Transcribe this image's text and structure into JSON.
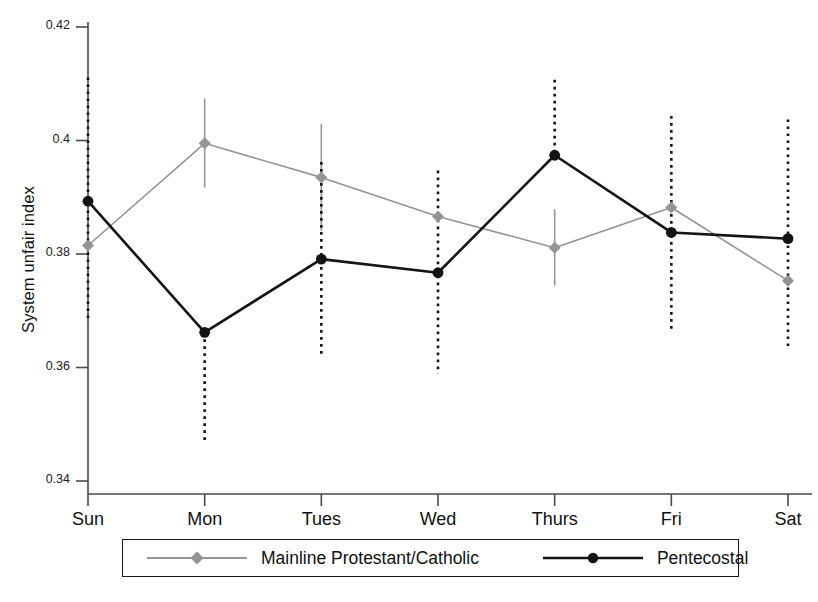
{
  "chart_data": {
    "type": "line",
    "title": "",
    "subtitle": "",
    "xlabel": "",
    "ylabel": "System unfair index",
    "categories": [
      "Sun",
      "Mon",
      "Tues",
      "Wed",
      "Thurs",
      "Fri",
      "Sat"
    ],
    "ylim": [
      0.34,
      0.42
    ],
    "yticks": [
      0.34,
      0.36,
      0.38,
      0.4,
      0.42
    ],
    "ytick_labels": [
      "0.34",
      "0.36",
      "0.38",
      "0.4",
      "0.42"
    ],
    "grid": false,
    "legend_position": "bottom",
    "error_bars": true,
    "series": [
      {
        "name": "Mainline Protestant/Catholic",
        "color": "#949494",
        "marker": "diamond",
        "line_style": "solid",
        "error_bar_style": "solid",
        "values": [
          0.3815,
          0.3995,
          0.3935,
          0.3866,
          0.3811,
          0.3882,
          0.3753
        ],
        "error_low": [
          0.3815,
          0.3917,
          0.3841,
          0.3866,
          0.3744,
          0.3882,
          0.3753
        ],
        "error_high": [
          0.3815,
          0.4074,
          0.4029,
          0.3866,
          0.3879,
          0.3882,
          0.3753
        ]
      },
      {
        "name": "Pentecostal",
        "color": "#141414",
        "marker": "circle",
        "line_style": "solid",
        "error_bar_style": "dotted",
        "values": [
          0.3893,
          0.3662,
          0.3791,
          0.3767,
          0.3974,
          0.3838,
          0.3827
        ],
        "error_low": [
          0.3679,
          0.3472,
          0.3622,
          0.3589,
          0.3974,
          0.3661,
          0.3638
        ],
        "error_high": [
          0.4111,
          0.3662,
          0.3962,
          0.3947,
          0.4107,
          0.4043,
          0.4037
        ]
      }
    ]
  },
  "legend": {
    "entries": [
      {
        "label": "Mainline Protestant/Catholic",
        "color": "#949494",
        "marker": "diamond"
      },
      {
        "label": "Pentecostal",
        "color": "#141414",
        "marker": "circle"
      }
    ]
  },
  "axes": {
    "y_axis_label": "System unfair index"
  }
}
